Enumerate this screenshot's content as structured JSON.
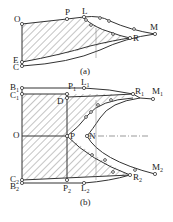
{
  "figure": {
    "panel_a": {
      "caption": "(a)",
      "points": {
        "O": "O",
        "P": "P",
        "L": "L",
        "M": "M",
        "R": "R",
        "E": "E",
        "C": "C"
      }
    },
    "panel_b": {
      "caption": "(b)",
      "points": {
        "B1": "B",
        "B1_sub": "1",
        "C1": "C",
        "C1_sub": "1",
        "P1": "P",
        "P1_sub": "1",
        "L1": "L",
        "L1_sub": "1",
        "R1": "R",
        "R1_sub": "1",
        "M1": "M",
        "M1_sub": "1",
        "D": "D",
        "O": "O",
        "P": "P",
        "N": "N",
        "C2": "C",
        "C2_sub": "2",
        "B2": "B",
        "B2_sub": "2",
        "P2": "P",
        "P2_sub": "2",
        "L2": "L",
        "L2_sub": "2",
        "R2": "R",
        "R2_sub": "2",
        "M2": "M",
        "M2_sub": "2"
      }
    },
    "colors": {
      "line": "#333333",
      "hatch": "#555555",
      "background": "#ffffff"
    }
  }
}
